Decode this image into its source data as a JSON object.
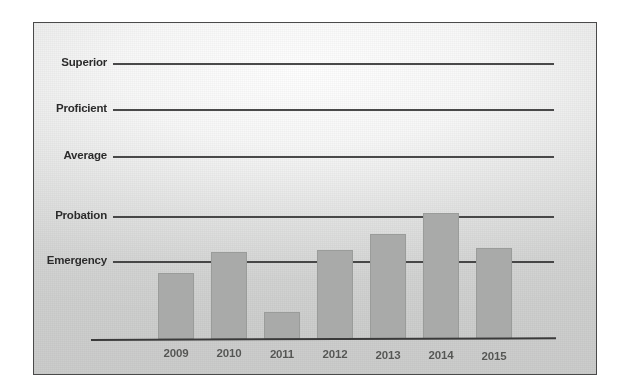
{
  "chart_data": {
    "type": "bar",
    "title": "",
    "subtitle": "",
    "xlabel": "",
    "ylabel": "",
    "grid": true,
    "legend": "none",
    "categories": [
      "2009",
      "2010",
      "2011",
      "2012",
      "2013",
      "2014",
      "2015"
    ],
    "y_tick_labels": [
      "Emergency",
      "Probation",
      "Average",
      "Proficient",
      "Superior"
    ],
    "y_axis_type": "ordinal-rating-scale",
    "ylim": [
      0,
      5.8
    ],
    "y_tick_values": [
      1,
      2,
      3,
      4,
      5
    ],
    "values": [
      0.85,
      1.2,
      0.35,
      1.25,
      1.6,
      2.05,
      1.3
    ],
    "series": [
      {
        "name": "School rating",
        "color": "#a9aaa9",
        "values": [
          0.85,
          1.2,
          0.35,
          1.25,
          1.6,
          2.05,
          1.3
        ]
      }
    ],
    "annotations": []
  },
  "axes": {
    "y_categories": [
      {
        "label": "Superior",
        "value": 5
      },
      {
        "label": "Proficient",
        "value": 4
      },
      {
        "label": "Average",
        "value": 3
      },
      {
        "label": "Probation",
        "value": 2
      },
      {
        "label": "Emergency",
        "value": 1
      }
    ],
    "x_categories": [
      {
        "label": "2009"
      },
      {
        "label": "2010"
      },
      {
        "label": "2011"
      },
      {
        "label": "2012"
      },
      {
        "label": "2013"
      },
      {
        "label": "2014"
      },
      {
        "label": "2015"
      }
    ]
  },
  "colors": {
    "bar_fill": "#a9aaa9",
    "gridline": "#3b3b3b",
    "axis_line": "#3a3a3a",
    "frame_border": "#4a4a4a",
    "panel_background": "#d6d7d6",
    "category_label_text": "#2b2b2b",
    "year_label_text": "#555654",
    "page_background": "#ffffff"
  }
}
